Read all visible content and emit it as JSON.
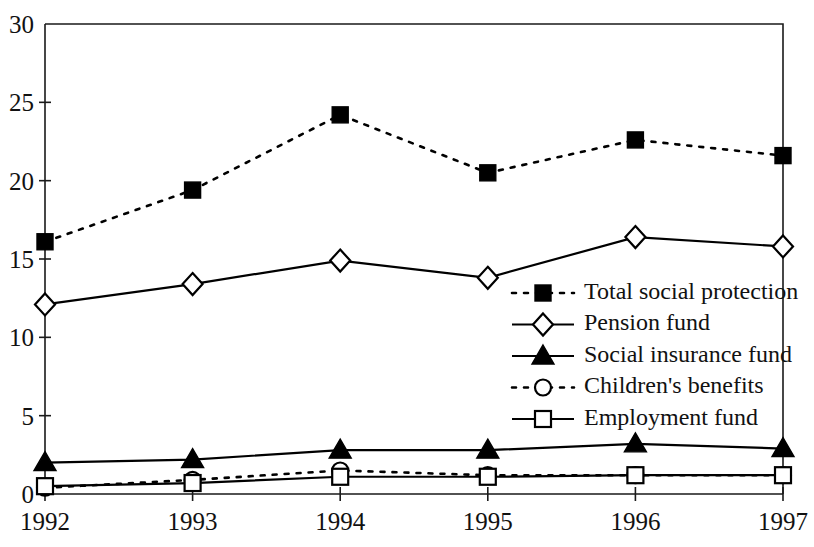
{
  "chart_data": {
    "type": "line",
    "title": "",
    "subtitle": "",
    "xlabel": "",
    "ylabel": "",
    "categories": [
      "1992",
      "1993",
      "1994",
      "1995",
      "1996",
      "1997"
    ],
    "x": [
      1992,
      1993,
      1994,
      1995,
      1996,
      1997
    ],
    "xlim": [
      1992,
      1997
    ],
    "ylim": [
      0,
      30
    ],
    "yticks": [
      0,
      5,
      10,
      15,
      20,
      25,
      30
    ],
    "ytick_labels": [
      "0",
      "5",
      "10",
      "15",
      "20",
      "25",
      "30"
    ],
    "xtick_labels": [
      "1992",
      "1993",
      "1994",
      "1995",
      "1996",
      "1997"
    ],
    "grid": false,
    "legend_position": "inside-right",
    "series": [
      {
        "name": "Total social protection",
        "values": [
          16.1,
          19.4,
          24.2,
          20.5,
          22.6,
          21.6
        ],
        "line_style": "dashed",
        "marker": "square-filled",
        "color": "#000000"
      },
      {
        "name": "Pension fund",
        "values": [
          12.1,
          13.4,
          14.9,
          13.8,
          16.4,
          15.8
        ],
        "line_style": "solid",
        "marker": "diamond-open",
        "color": "#000000"
      },
      {
        "name": "Social insurance fund",
        "values": [
          2.0,
          2.2,
          2.8,
          2.8,
          3.2,
          2.9
        ],
        "line_style": "solid",
        "marker": "triangle-filled",
        "color": "#000000"
      },
      {
        "name": "Children's benefits",
        "values": [
          0.4,
          0.9,
          1.5,
          1.2,
          1.2,
          1.2
        ],
        "line_style": "dashed",
        "marker": "circle-open",
        "color": "#000000"
      },
      {
        "name": "Employment fund",
        "values": [
          0.5,
          0.7,
          1.1,
          1.1,
          1.2,
          1.2
        ],
        "line_style": "solid",
        "marker": "square-open",
        "color": "#000000"
      }
    ]
  },
  "legend": {
    "entries": [
      {
        "label": "Total social protection"
      },
      {
        "label": "Pension fund"
      },
      {
        "label": "Social insurance fund"
      },
      {
        "label": "Children's benefits"
      },
      {
        "label": "Employment fund"
      }
    ]
  },
  "axes": {
    "y_labels": [
      "30",
      "25",
      "20",
      "15",
      "10",
      "5",
      "0"
    ],
    "x_labels": [
      "1992",
      "1993",
      "1994",
      "1995",
      "1996",
      "1997"
    ]
  }
}
